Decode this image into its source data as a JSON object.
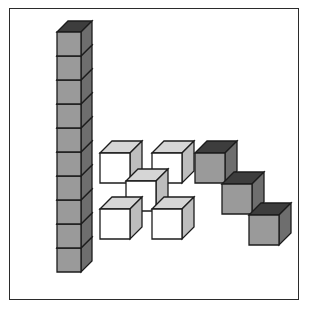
{
  "page": {
    "width": 319,
    "height": 318,
    "background_color": "#ffffff",
    "title": "Cube arrangement figure"
  },
  "frame": {
    "name": "figure-border",
    "x": 9,
    "y": 8,
    "width": 290,
    "height": 292,
    "border_color": "#2b2b2b",
    "border_width": 1.5,
    "fill": "#ffffff"
  },
  "colors": {
    "gray_front": "#9a9a9a",
    "gray_top": "#3d3d3d",
    "gray_side": "#6e6e6e",
    "white_front": "#ffffff",
    "white_top": "#d6d6d6",
    "white_side": "#bdbdbd",
    "outline": "#1c1c1c"
  },
  "chart_data": {
    "type": "diagram",
    "title": "Cube arrangement figure",
    "groups": [
      {
        "name": "tower",
        "label": "Vertical stack of gray cubes",
        "cube_count": 10,
        "cube_style": "gray",
        "orientation": "vertical-stack",
        "cube_size": 24,
        "origin_x": 57,
        "origin_y": 248,
        "depth": 11,
        "cubes": [
          {
            "col": 0,
            "row": 0
          },
          {
            "col": 0,
            "row": 1
          },
          {
            "col": 0,
            "row": 2
          },
          {
            "col": 0,
            "row": 3
          },
          {
            "col": 0,
            "row": 4
          },
          {
            "col": 0,
            "row": 5
          },
          {
            "col": 0,
            "row": 6
          },
          {
            "col": 0,
            "row": 7
          },
          {
            "col": 0,
            "row": 8
          },
          {
            "col": 0,
            "row": 9
          }
        ]
      },
      {
        "name": "plus-cluster",
        "label": "Five white cubes in a plus arrangement",
        "cube_count": 5,
        "cube_style": "white",
        "orientation": "quincunx",
        "cube_size": 30,
        "origin_x": 100,
        "origin_y": 153,
        "depth": 12,
        "cubes": [
          {
            "x": 0,
            "y": 0
          },
          {
            "x": 52,
            "y": 0
          },
          {
            "x": 26,
            "y": 28
          },
          {
            "x": 0,
            "y": 56
          },
          {
            "x": 52,
            "y": 56
          }
        ]
      },
      {
        "name": "staircase",
        "label": "Three gray cubes in a descending diagonal",
        "cube_count": 3,
        "cube_style": "gray",
        "orientation": "descending-diagonal",
        "cube_size": 30,
        "origin_x": 195,
        "origin_y": 153,
        "depth": 12,
        "cubes": [
          {
            "x": 0,
            "y": 0
          },
          {
            "x": 27,
            "y": 31
          },
          {
            "x": 54,
            "y": 62
          }
        ]
      }
    ],
    "total_cubes": 18
  }
}
